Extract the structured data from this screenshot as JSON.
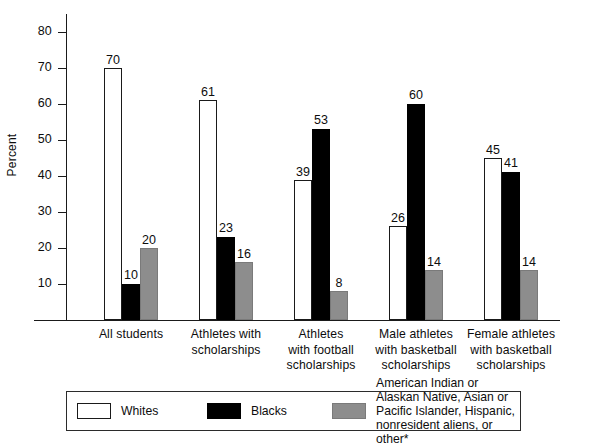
{
  "chart_data": {
    "type": "bar",
    "title": "",
    "xlabel": "",
    "ylabel": "Percent",
    "ylim": [
      0,
      85
    ],
    "yticks": [
      10,
      20,
      30,
      40,
      50,
      60,
      70,
      80
    ],
    "grid": false,
    "legend_position": "bottom",
    "categories": [
      "All students",
      "Athletes with\nscholarships",
      "Athletes\nwith football\nscholarships",
      "Male athletes\nwith basketball\nscholarships",
      "Female athletes\nwith basketball\nscholarships"
    ],
    "series": [
      {
        "name": "Whites",
        "color": "#ffffff",
        "values": [
          70,
          61,
          39,
          26,
          45
        ]
      },
      {
        "name": "Blacks",
        "color": "#000000",
        "values": [
          10,
          23,
          53,
          60,
          41
        ]
      },
      {
        "name": "American Indian or Alaskan Native, Asian or\nPacific Islander, Hispanic, nonresident aliens, or other*",
        "color": "#8d8d8d",
        "values": [
          20,
          16,
          8,
          14,
          14
        ]
      }
    ]
  },
  "legend": {
    "items": [
      {
        "label": "Whites",
        "swatch": "whites"
      },
      {
        "label": "Blacks",
        "swatch": "blacks"
      },
      {
        "label": "American Indian or Alaskan Native, Asian or\nPacific Islander, Hispanic, nonresident aliens, or other*",
        "swatch": "other"
      }
    ]
  }
}
